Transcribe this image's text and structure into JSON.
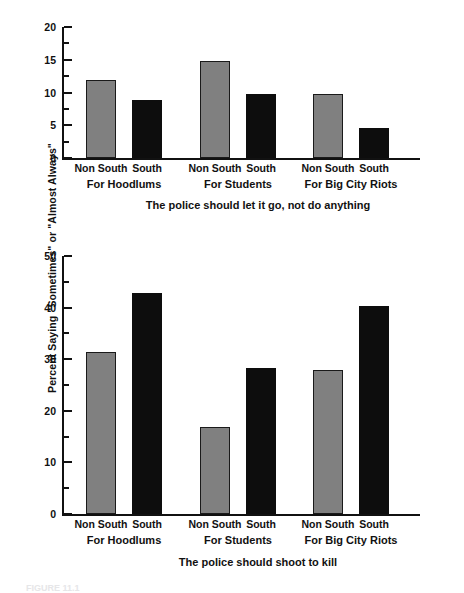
{
  "figure": {
    "ylabel": "Percent Saying \"Sometimes\" or \"Almost Always\"",
    "caption_partial": "FIGURE 11.1"
  },
  "chart_data": [
    {
      "type": "bar",
      "title": "The police should let it go, not do anything",
      "xlabel": "",
      "ylabel": "Percent Saying \"Sometimes\" or \"Almost Always\"",
      "ylim": [
        0,
        20
      ],
      "yticks": [
        0,
        5,
        10,
        15,
        20
      ],
      "ytick_labels": [
        "0",
        "5",
        "10",
        "15",
        "20"
      ],
      "minor_yticks": [
        2.5,
        7.5,
        12.5,
        17.5
      ],
      "grid": false,
      "legend": "none",
      "groups": [
        "For Hoodlums",
        "For Students",
        "For Big City Riots"
      ],
      "categories": [
        "Non South",
        "South"
      ],
      "series": [
        {
          "name": "Non South",
          "color": "#808080",
          "values": [
            11.9,
            14.8,
            9.7
          ]
        },
        {
          "name": "South",
          "color": "#0d0d0d",
          "values": [
            8.8,
            9.7,
            4.6
          ]
        }
      ]
    },
    {
      "type": "bar",
      "title": "The police should shoot to kill",
      "xlabel": "",
      "ylabel": "Percent Saying \"Sometimes\" or \"Almost Always\"",
      "ylim": [
        0,
        50
      ],
      "yticks": [
        0,
        10,
        20,
        30,
        40,
        50
      ],
      "ytick_labels": [
        "0",
        "10",
        "20",
        "30",
        "40",
        "50"
      ],
      "minor_yticks": [
        5,
        15,
        25,
        35,
        45
      ],
      "grid": false,
      "legend": "none",
      "groups": [
        "For Hoodlums",
        "For Students",
        "For Big City Riots"
      ],
      "categories": [
        "Non South",
        "South"
      ],
      "series": [
        {
          "name": "Non South",
          "color": "#808080",
          "values": [
            31.3,
            16.8,
            28.0
          ]
        },
        {
          "name": "South",
          "color": "#0d0d0d",
          "values": [
            42.8,
            28.2,
            40.3
          ]
        }
      ]
    }
  ]
}
